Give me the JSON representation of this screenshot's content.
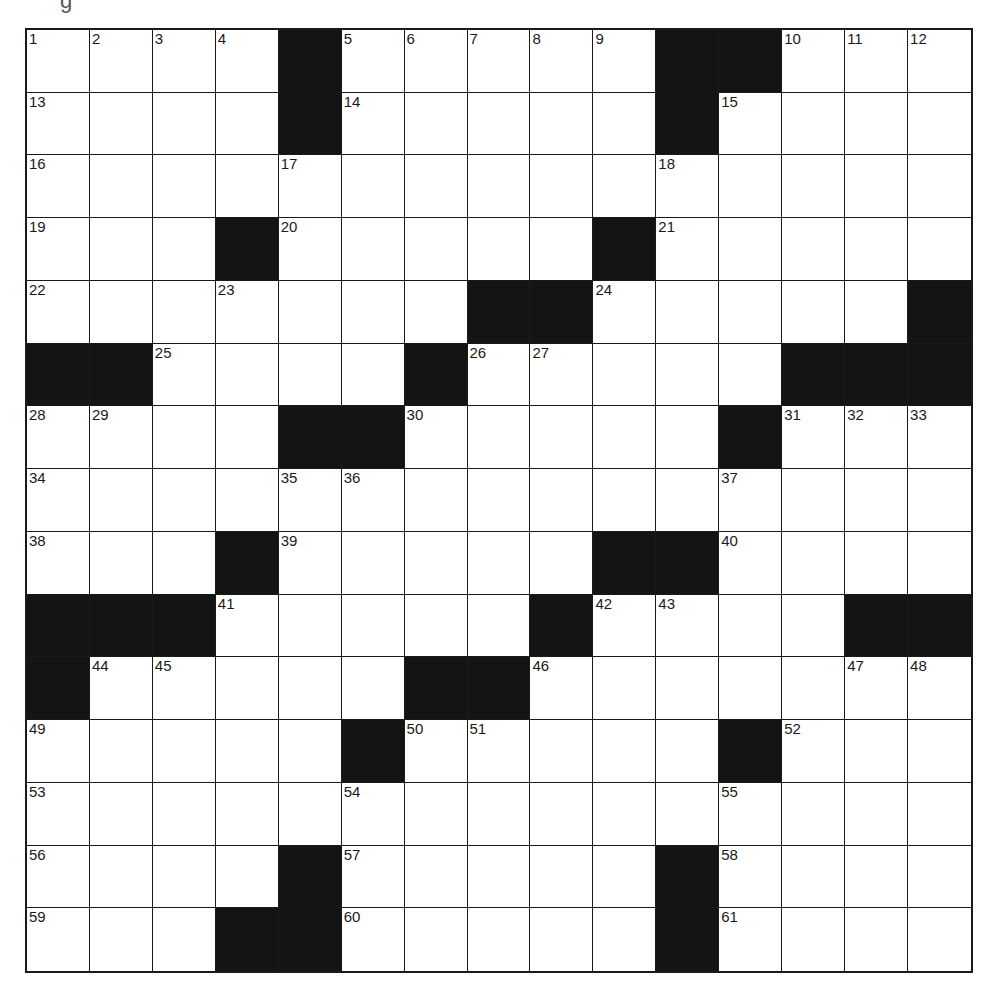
{
  "header": {
    "fragment": "g"
  },
  "puzzle": {
    "rows": 15,
    "cols": 15,
    "colors": {
      "block": "#141414",
      "cell": "#ffffff",
      "line": "#1a1a1a"
    },
    "blocks": [
      [
        0,
        4
      ],
      [
        0,
        10
      ],
      [
        0,
        11
      ],
      [
        1,
        4
      ],
      [
        1,
        10
      ],
      [
        3,
        3
      ],
      [
        3,
        9
      ],
      [
        4,
        7
      ],
      [
        4,
        8
      ],
      [
        4,
        14
      ],
      [
        5,
        0
      ],
      [
        5,
        1
      ],
      [
        5,
        6
      ],
      [
        5,
        12
      ],
      [
        5,
        13
      ],
      [
        5,
        14
      ],
      [
        6,
        4
      ],
      [
        6,
        5
      ],
      [
        6,
        11
      ],
      [
        8,
        3
      ],
      [
        8,
        9
      ],
      [
        8,
        10
      ],
      [
        9,
        0
      ],
      [
        9,
        1
      ],
      [
        9,
        2
      ],
      [
        9,
        8
      ],
      [
        9,
        13
      ],
      [
        9,
        14
      ],
      [
        10,
        0
      ],
      [
        10,
        6
      ],
      [
        10,
        7
      ],
      [
        11,
        5
      ],
      [
        11,
        11
      ],
      [
        13,
        4
      ],
      [
        13,
        10
      ],
      [
        14,
        3
      ],
      [
        14,
        4
      ],
      [
        14,
        10
      ]
    ],
    "numbers": [
      {
        "r": 0,
        "c": 0,
        "n": "1"
      },
      {
        "r": 0,
        "c": 1,
        "n": "2"
      },
      {
        "r": 0,
        "c": 2,
        "n": "3"
      },
      {
        "r": 0,
        "c": 3,
        "n": "4"
      },
      {
        "r": 0,
        "c": 5,
        "n": "5"
      },
      {
        "r": 0,
        "c": 6,
        "n": "6"
      },
      {
        "r": 0,
        "c": 7,
        "n": "7"
      },
      {
        "r": 0,
        "c": 8,
        "n": "8"
      },
      {
        "r": 0,
        "c": 9,
        "n": "9"
      },
      {
        "r": 0,
        "c": 12,
        "n": "10"
      },
      {
        "r": 0,
        "c": 13,
        "n": "11"
      },
      {
        "r": 0,
        "c": 14,
        "n": "12"
      },
      {
        "r": 1,
        "c": 0,
        "n": "13"
      },
      {
        "r": 1,
        "c": 5,
        "n": "14"
      },
      {
        "r": 1,
        "c": 11,
        "n": "15"
      },
      {
        "r": 2,
        "c": 0,
        "n": "16"
      },
      {
        "r": 2,
        "c": 4,
        "n": "17"
      },
      {
        "r": 2,
        "c": 10,
        "n": "18"
      },
      {
        "r": 3,
        "c": 0,
        "n": "19"
      },
      {
        "r": 3,
        "c": 4,
        "n": "20"
      },
      {
        "r": 3,
        "c": 10,
        "n": "21"
      },
      {
        "r": 4,
        "c": 0,
        "n": "22"
      },
      {
        "r": 4,
        "c": 3,
        "n": "23"
      },
      {
        "r": 4,
        "c": 9,
        "n": "24"
      },
      {
        "r": 5,
        "c": 2,
        "n": "25"
      },
      {
        "r": 5,
        "c": 7,
        "n": "26"
      },
      {
        "r": 5,
        "c": 8,
        "n": "27"
      },
      {
        "r": 6,
        "c": 0,
        "n": "28"
      },
      {
        "r": 6,
        "c": 1,
        "n": "29"
      },
      {
        "r": 6,
        "c": 6,
        "n": "30"
      },
      {
        "r": 6,
        "c": 12,
        "n": "31"
      },
      {
        "r": 6,
        "c": 13,
        "n": "32"
      },
      {
        "r": 6,
        "c": 14,
        "n": "33"
      },
      {
        "r": 7,
        "c": 0,
        "n": "34"
      },
      {
        "r": 7,
        "c": 4,
        "n": "35"
      },
      {
        "r": 7,
        "c": 5,
        "n": "36"
      },
      {
        "r": 7,
        "c": 11,
        "n": "37"
      },
      {
        "r": 8,
        "c": 0,
        "n": "38"
      },
      {
        "r": 8,
        "c": 4,
        "n": "39"
      },
      {
        "r": 8,
        "c": 11,
        "n": "40"
      },
      {
        "r": 9,
        "c": 3,
        "n": "41"
      },
      {
        "r": 9,
        "c": 9,
        "n": "42"
      },
      {
        "r": 9,
        "c": 10,
        "n": "43"
      },
      {
        "r": 10,
        "c": 1,
        "n": "44"
      },
      {
        "r": 10,
        "c": 2,
        "n": "45"
      },
      {
        "r": 10,
        "c": 8,
        "n": "46"
      },
      {
        "r": 10,
        "c": 13,
        "n": "47"
      },
      {
        "r": 10,
        "c": 14,
        "n": "48"
      },
      {
        "r": 11,
        "c": 0,
        "n": "49"
      },
      {
        "r": 11,
        "c": 6,
        "n": "50"
      },
      {
        "r": 11,
        "c": 7,
        "n": "51"
      },
      {
        "r": 11,
        "c": 12,
        "n": "52"
      },
      {
        "r": 12,
        "c": 0,
        "n": "53"
      },
      {
        "r": 12,
        "c": 5,
        "n": "54"
      },
      {
        "r": 12,
        "c": 11,
        "n": "55"
      },
      {
        "r": 13,
        "c": 0,
        "n": "56"
      },
      {
        "r": 13,
        "c": 5,
        "n": "57"
      },
      {
        "r": 13,
        "c": 11,
        "n": "58"
      },
      {
        "r": 14,
        "c": 0,
        "n": "59"
      },
      {
        "r": 14,
        "c": 5,
        "n": "60"
      },
      {
        "r": 14,
        "c": 11,
        "n": "61"
      }
    ],
    "letters": []
  }
}
